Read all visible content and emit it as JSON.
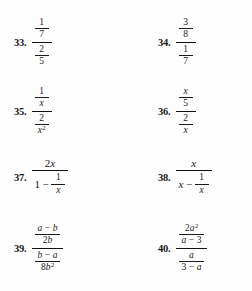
{
  "page": {
    "kind": "math-textbook-exercise-list",
    "background_color": "#fdfdfd",
    "text_color": "#1a1a1a",
    "topic": "complex fractions"
  },
  "exercises": [
    {
      "number": "33.",
      "column": "left",
      "expression": "(1/7) / (2/5)",
      "numerator": {
        "top": "1",
        "bottom": "7"
      },
      "denominator": {
        "top": "2",
        "bottom": "5"
      }
    },
    {
      "number": "34.",
      "column": "right",
      "expression": "(3/8) / (1/7)",
      "numerator": {
        "top": "3",
        "bottom": "8"
      },
      "denominator": {
        "top": "1",
        "bottom": "7"
      }
    },
    {
      "number": "35.",
      "column": "left",
      "expression": "(1/x) / (2/x^2)",
      "numerator": {
        "top": "1",
        "bottom": "x"
      },
      "denominator": {
        "top": "2",
        "bottom_base": "x",
        "bottom_exponent": "2"
      }
    },
    {
      "number": "36.",
      "column": "right",
      "expression": "(x/5) / (2/x)",
      "numerator": {
        "top": "x",
        "bottom": "5"
      },
      "denominator": {
        "top": "2",
        "bottom": "x"
      }
    },
    {
      "number": "37.",
      "column": "left",
      "expression": "2x / (1 - 1/x)",
      "numerator": {
        "coefficient": "2",
        "variable": "x"
      },
      "denominator": {
        "lead": "1",
        "operator": "−",
        "frac_top": "1",
        "frac_bottom": "x"
      }
    },
    {
      "number": "38.",
      "column": "right",
      "expression": "x / (x - 1/x)",
      "numerator": {
        "variable": "x"
      },
      "denominator": {
        "lead": "x",
        "operator": "−",
        "frac_top": "1",
        "frac_bottom": "x"
      }
    },
    {
      "number": "39.",
      "column": "left",
      "expression": "((a - b)/2b) / ((b - a)/8b^2)",
      "numerator": {
        "top_left": "a",
        "top_operator": "−",
        "top_right": "b",
        "bottom_coefficient": "2",
        "bottom_variable": "b"
      },
      "denominator": {
        "top_left": "b",
        "top_operator": "−",
        "top_right": "a",
        "bottom_coefficient": "8",
        "bottom_variable": "b",
        "bottom_exponent": "2"
      }
    },
    {
      "number": "40.",
      "column": "right",
      "expression": "(2a^2/(a - 3)) / (a/(3 - a))",
      "numerator": {
        "top_coefficient": "2",
        "top_variable": "a",
        "top_exponent": "2",
        "bottom_left": "a",
        "bottom_operator": "−",
        "bottom_right": "3"
      },
      "denominator": {
        "top_variable": "a",
        "bottom_left": "3",
        "bottom_operator": "−",
        "bottom_right": "a"
      }
    }
  ]
}
